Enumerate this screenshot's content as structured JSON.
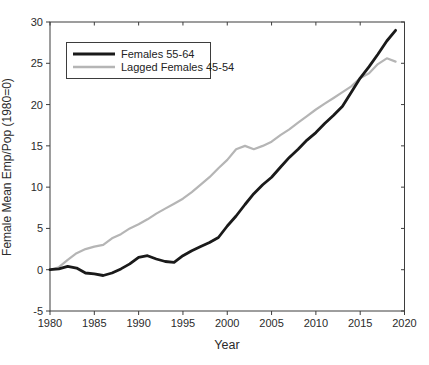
{
  "colors": {
    "background": "#ffffff",
    "axis": "#3d3d3d",
    "text": "#2b2b2b",
    "series_black": "#1a1a1a",
    "series_gray": "#b5b5b5"
  },
  "x_axis_title": "Year",
  "y_axis_title": "Female Mean Emp/Pop (1980=0)",
  "chart_data": {
    "type": "line",
    "title": "",
    "xlabel": "Year",
    "ylabel": "Female Mean Emp/Pop (1980=0)",
    "xlim": [
      1980,
      2020
    ],
    "ylim": [
      -5,
      30
    ],
    "x_ticks": [
      1980,
      1985,
      1990,
      1995,
      2000,
      2005,
      2010,
      2015,
      2020
    ],
    "y_ticks": [
      -5,
      0,
      5,
      10,
      15,
      20,
      25,
      30
    ],
    "grid": false,
    "legend_position": "upper-left",
    "x": [
      1980,
      1981,
      1982,
      1983,
      1984,
      1985,
      1986,
      1987,
      1988,
      1989,
      1990,
      1991,
      1992,
      1993,
      1994,
      1995,
      1996,
      1997,
      1998,
      1999,
      2000,
      2001,
      2002,
      2003,
      2004,
      2005,
      2006,
      2007,
      2008,
      2009,
      2010,
      2011,
      2012,
      2013,
      2014,
      2015,
      2016,
      2017,
      2018,
      2019
    ],
    "series": [
      {
        "name": "Females 55-64",
        "color": "#1a1a1a",
        "line_width": 2.8,
        "values": [
          0,
          0.1,
          0.4,
          0.2,
          -0.4,
          -0.5,
          -0.7,
          -0.4,
          0.1,
          0.7,
          1.5,
          1.7,
          1.3,
          1.0,
          0.9,
          1.7,
          2.3,
          2.8,
          3.3,
          3.9,
          5.3,
          6.5,
          7.9,
          9.2,
          10.3,
          11.2,
          12.4,
          13.6,
          14.6,
          15.7,
          16.6,
          17.7,
          18.7,
          19.8,
          21.5,
          23.2,
          24.6,
          26.1,
          27.7,
          29.0
        ]
      },
      {
        "name": "Lagged Females 45-54",
        "color": "#b5b5b5",
        "line_width": 2.2,
        "values": [
          0,
          0.3,
          1.2,
          2.0,
          2.5,
          2.8,
          3.0,
          3.8,
          4.3,
          5.0,
          5.5,
          6.1,
          6.8,
          7.4,
          8.0,
          8.6,
          9.4,
          10.3,
          11.2,
          12.3,
          13.3,
          14.6,
          15.0,
          14.6,
          15.0,
          15.5,
          16.3,
          17.0,
          17.8,
          18.6,
          19.4,
          20.1,
          20.8,
          21.5,
          22.2,
          23.2,
          23.8,
          24.9,
          25.6,
          25.2
        ]
      }
    ]
  }
}
